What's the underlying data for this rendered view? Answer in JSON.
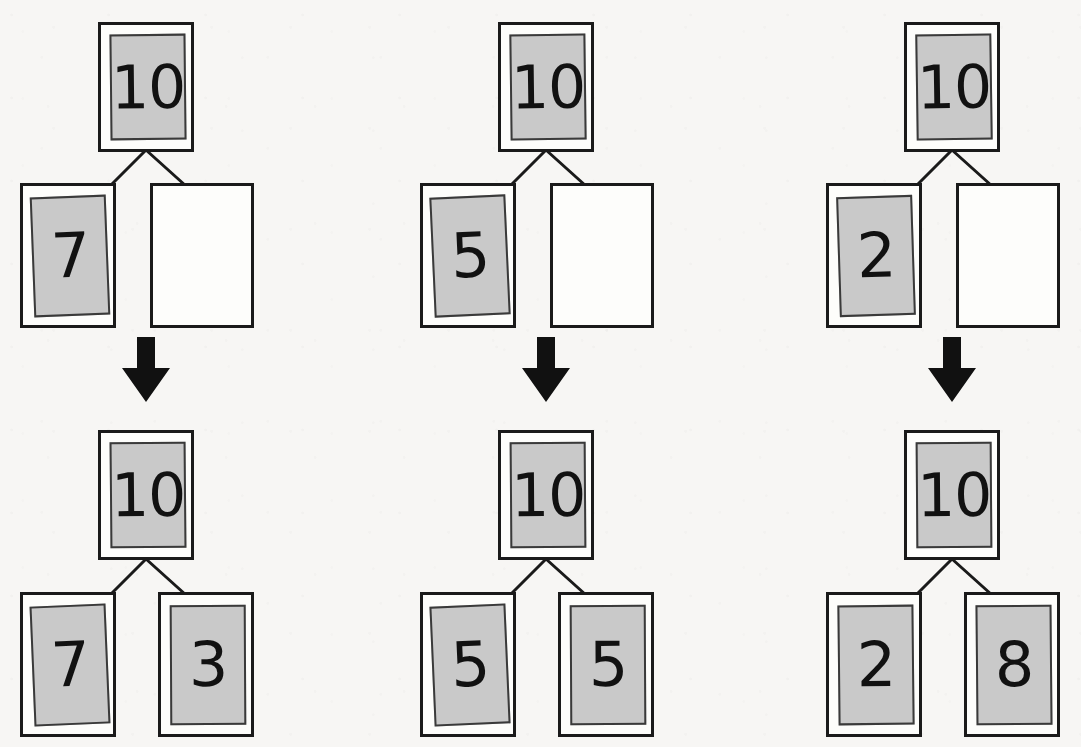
{
  "diagram": {
    "background_color": "#f7f6f4",
    "card_fill_color": "#c9c9c9",
    "stroke_color": "#1a1a1a",
    "text_color": "#111111",
    "arrow_color": "#111111"
  },
  "columns": [
    {
      "id": "column-1",
      "label": "decomposition-10-7-3",
      "before": {
        "root": {
          "value": "10",
          "filled": true
        },
        "left": {
          "value": "7",
          "filled": true
        },
        "right": {
          "value": "",
          "filled": false
        }
      },
      "after": {
        "root": {
          "value": "10",
          "filled": true
        },
        "left": {
          "value": "7",
          "filled": true
        },
        "right": {
          "value": "3",
          "filled": true
        }
      },
      "arrow": "down-arrow"
    },
    {
      "id": "column-2",
      "label": "decomposition-10-5-5",
      "before": {
        "root": {
          "value": "10",
          "filled": true
        },
        "left": {
          "value": "5",
          "filled": true
        },
        "right": {
          "value": "",
          "filled": false
        }
      },
      "after": {
        "root": {
          "value": "10",
          "filled": true
        },
        "left": {
          "value": "5",
          "filled": true
        },
        "right": {
          "value": "5",
          "filled": true
        }
      },
      "arrow": "down-arrow"
    },
    {
      "id": "column-3",
      "label": "decomposition-10-2-8",
      "before": {
        "root": {
          "value": "10",
          "filled": true
        },
        "left": {
          "value": "2",
          "filled": true
        },
        "right": {
          "value": "",
          "filled": false
        }
      },
      "after": {
        "root": {
          "value": "10",
          "filled": true
        },
        "left": {
          "value": "2",
          "filled": true
        },
        "right": {
          "value": "8",
          "filled": true
        }
      },
      "arrow": "down-arrow"
    }
  ]
}
